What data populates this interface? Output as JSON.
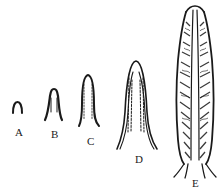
{
  "figure": {
    "stages": [
      {
        "id": "A",
        "label": "A"
      },
      {
        "id": "B",
        "label": "B"
      },
      {
        "id": "C",
        "label": "C"
      },
      {
        "id": "D",
        "label": "D"
      },
      {
        "id": "E",
        "label": "E"
      }
    ],
    "colors": {
      "ink": "#1a1a1a",
      "background": "#ffffff"
    }
  }
}
